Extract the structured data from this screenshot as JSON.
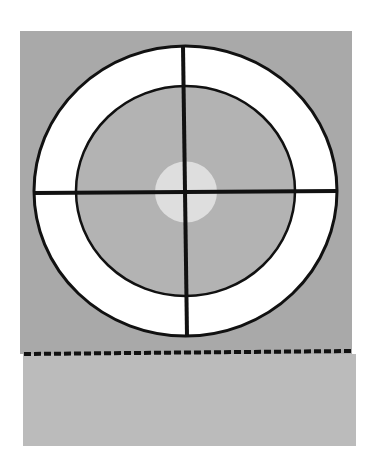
{
  "figure": {
    "colors": {
      "background": "#ffffff",
      "upper_field": "#a9a9a9",
      "lower_band": "#bbbbbb",
      "outer_ring_fill": "#ffffff",
      "inner_disc_fill": "#b3b3b3",
      "center_dot": "#dedede",
      "stroke": "#111111"
    },
    "shapes": {
      "upper_field": {
        "x": 20,
        "y": 31,
        "w": 332,
        "h": 323
      },
      "lower_band": {
        "x": 23,
        "y": 354,
        "w": 333,
        "h": 92
      },
      "outer_ellipse": {
        "cx": 185.5,
        "cy": 191,
        "rx": 151.5,
        "ry": 145
      },
      "inner_ellipse": {
        "cx": 185.5,
        "cy": 191,
        "rx": 109.5,
        "ry": 105
      },
      "center_dot": {
        "cx": 186,
        "cy": 192,
        "rx": 31,
        "ry": 30.5
      },
      "vertical_line": {
        "x1": 183,
        "y1": 46,
        "x2": 187,
        "y2": 336
      },
      "horizontal_line": {
        "x1": 34,
        "y1": 193,
        "x2": 337,
        "y2": 191
      },
      "dashed_line": {
        "x1": 24,
        "y1": 354,
        "x2": 351,
        "y2": 351,
        "dash": "7 3",
        "width": 4
      }
    }
  }
}
